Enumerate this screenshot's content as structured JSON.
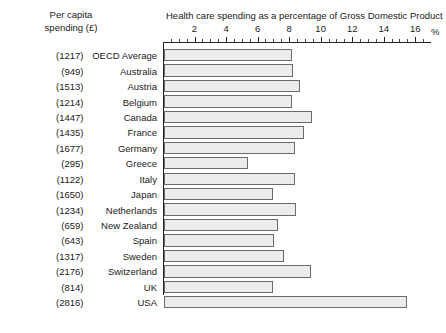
{
  "header": {
    "left_col_line1": "Per capita",
    "left_col_line2": "spending (£)",
    "title": "Health care spending as a percentage of Gross Domestic Product",
    "percent_sign": "%"
  },
  "chart_data": {
    "type": "bar",
    "orientation": "horizontal",
    "title": "Health care spending as a percentage of Gross Domestic Product",
    "xlabel": "%",
    "ylabel": "",
    "xlim": [
      0,
      17
    ],
    "grid": false,
    "legend": null,
    "axis_position": "top",
    "tick_labels": [
      "2",
      "4",
      "6",
      "8",
      "10",
      "12",
      "14",
      "16"
    ],
    "ticks": [
      2,
      4,
      6,
      8,
      10,
      12,
      14,
      16
    ],
    "minor_tick_step": 0.5,
    "categories": [
      "OECD Average",
      "Australia",
      "Austria",
      "Belgium",
      "Canada",
      "France",
      "Germany",
      "Greece",
      "Italy",
      "Japan",
      "Netherlands",
      "New Zealand",
      "Spain",
      "Sweden",
      "Switzerland",
      "UK",
      "USA"
    ],
    "values": [
      8.1,
      8.2,
      8.6,
      8.1,
      9.4,
      8.9,
      8.3,
      5.3,
      8.3,
      6.9,
      8.4,
      7.2,
      7.0,
      7.6,
      9.3,
      6.9,
      15.4
    ],
    "series": [
      {
        "name": "Health care spending (% of GDP)",
        "values": [
          8.1,
          8.2,
          8.6,
          8.1,
          9.4,
          8.9,
          8.3,
          5.3,
          8.3,
          6.9,
          8.4,
          7.2,
          7.0,
          7.6,
          9.3,
          6.9,
          15.4
        ]
      }
    ],
    "per_capita_spending": [
      "(1217)",
      "(949)",
      "(1513)",
      "(1214)",
      "(1447)",
      "(1435)",
      "(1677)",
      "(295)",
      "(1122)",
      "(1650)",
      "(1234)",
      "(659)",
      "(643)",
      "(1317)",
      "(2176)",
      "(814)",
      "(2816)"
    ]
  },
  "rows": [
    {
      "spend": "(1217)",
      "country": "OECD Average",
      "value": 8.1
    },
    {
      "spend": "(949)",
      "country": "Australia",
      "value": 8.2
    },
    {
      "spend": "(1513)",
      "country": "Austria",
      "value": 8.6
    },
    {
      "spend": "(1214)",
      "country": "Belgium",
      "value": 8.1
    },
    {
      "spend": "(1447)",
      "country": "Canada",
      "value": 9.4
    },
    {
      "spend": "(1435)",
      "country": "France",
      "value": 8.9
    },
    {
      "spend": "(1677)",
      "country": "Germany",
      "value": 8.3
    },
    {
      "spend": "(295)",
      "country": "Greece",
      "value": 5.3
    },
    {
      "spend": "(1122)",
      "country": "Italy",
      "value": 8.3
    },
    {
      "spend": "(1650)",
      "country": "Japan",
      "value": 6.9
    },
    {
      "spend": "(1234)",
      "country": "Netherlands",
      "value": 8.4
    },
    {
      "spend": "(659)",
      "country": "New Zealand",
      "value": 7.2
    },
    {
      "spend": "(643)",
      "country": "Spain",
      "value": 7.0
    },
    {
      "spend": "(1317)",
      "country": "Sweden",
      "value": 7.6
    },
    {
      "spend": "(2176)",
      "country": "Switzerland",
      "value": 9.3
    },
    {
      "spend": "(814)",
      "country": "UK",
      "value": 6.9
    },
    {
      "spend": "(2816)",
      "country": "USA",
      "value": 15.4
    }
  ],
  "style": {
    "bar_fill": "#ececec",
    "bar_border": "#6b6b6b",
    "axis_color": "#222222",
    "text_color": "#1a1a1a",
    "background": "#ffffff"
  }
}
